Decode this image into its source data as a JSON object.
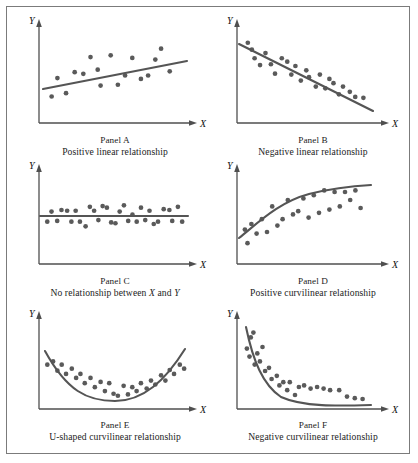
{
  "figure": {
    "border_color": "#7b7b7b",
    "background": "#ffffff",
    "axis_color": "#4f4f4f",
    "point_color": "#5a5a5a",
    "curve_color": "#555555",
    "axis_label_x": "X",
    "axis_label_y": "Y"
  },
  "chart_data": [
    {
      "type": "scatter",
      "id": "panel-a",
      "title": "Panel A",
      "subtitle": "Positive linear relationship",
      "xlabel": "X",
      "ylabel": "Y",
      "xlim": [
        0,
        100
      ],
      "ylim": [
        0,
        100
      ],
      "grid": false,
      "legend": "none",
      "fit": {
        "kind": "line",
        "description": "positive linear trend",
        "y_at_xmin": 38,
        "y_at_xmax": 68
      },
      "points": [
        [
          6,
          22
        ],
        [
          10,
          44
        ],
        [
          16,
          26
        ],
        [
          22,
          51
        ],
        [
          28,
          49
        ],
        [
          33,
          69
        ],
        [
          38,
          54
        ],
        [
          40,
          35
        ],
        [
          47,
          71
        ],
        [
          52,
          36
        ],
        [
          57,
          47
        ],
        [
          62,
          68
        ],
        [
          68,
          43
        ],
        [
          73,
          47
        ],
        [
          78,
          66
        ],
        [
          82,
          79
        ],
        [
          88,
          52
        ]
      ]
    },
    {
      "type": "scatter",
      "id": "panel-b",
      "title": "Panel B",
      "subtitle": "Negative linear relationship",
      "xlabel": "X",
      "ylabel": "Y",
      "xlim": [
        0,
        100
      ],
      "ylim": [
        0,
        100
      ],
      "grid": false,
      "legend": "none",
      "fit": {
        "kind": "line",
        "description": "negative linear trend",
        "y_at_xmin": 80,
        "y_at_xmax": 14
      },
      "points": [
        [
          5,
          84
        ],
        [
          8,
          76
        ],
        [
          10,
          66
        ],
        [
          14,
          58
        ],
        [
          18,
          72
        ],
        [
          22,
          59
        ],
        [
          25,
          48
        ],
        [
          30,
          66
        ],
        [
          34,
          62
        ],
        [
          37,
          47
        ],
        [
          40,
          57
        ],
        [
          44,
          40
        ],
        [
          48,
          52
        ],
        [
          50,
          44
        ],
        [
          55,
          33
        ],
        [
          58,
          47
        ],
        [
          62,
          31
        ],
        [
          65,
          42
        ],
        [
          68,
          37
        ],
        [
          72,
          24
        ],
        [
          75,
          33
        ],
        [
          80,
          27
        ],
        [
          84,
          21
        ],
        [
          90,
          20
        ]
      ]
    },
    {
      "type": "scatter",
      "id": "panel-c",
      "title": "Panel C",
      "subtitle": "No relationship between X and Y",
      "subtitle_parts": [
        "No relationship between ",
        "X",
        " and ",
        "Y"
      ],
      "xlabel": "X",
      "ylabel": "Y",
      "xlim": [
        0,
        100
      ],
      "ylim": [
        0,
        100
      ],
      "grid": false,
      "legend": "none",
      "fit": {
        "kind": "line",
        "description": "flat horizontal trend",
        "y_at_xmin": 50,
        "y_at_xmax": 50
      },
      "points": [
        [
          3,
          44
        ],
        [
          6,
          57
        ],
        [
          10,
          45
        ],
        [
          13,
          59
        ],
        [
          17,
          58
        ],
        [
          20,
          44
        ],
        [
          23,
          58
        ],
        [
          26,
          44
        ],
        [
          30,
          38
        ],
        [
          33,
          63
        ],
        [
          36,
          58
        ],
        [
          39,
          46
        ],
        [
          42,
          64
        ],
        [
          45,
          62
        ],
        [
          48,
          43
        ],
        [
          51,
          42
        ],
        [
          54,
          57
        ],
        [
          57,
          65
        ],
        [
          60,
          45
        ],
        [
          63,
          53
        ],
        [
          66,
          44
        ],
        [
          69,
          62
        ],
        [
          72,
          46
        ],
        [
          75,
          58
        ],
        [
          78,
          41
        ],
        [
          81,
          44
        ],
        [
          85,
          60
        ],
        [
          89,
          59
        ],
        [
          91,
          45
        ],
        [
          95,
          63
        ],
        [
          98,
          44
        ]
      ]
    },
    {
      "type": "scatter",
      "id": "panel-d",
      "title": "Panel D",
      "subtitle": "Positive curvilinear relationship",
      "xlabel": "X",
      "ylabel": "Y",
      "xlim": [
        0,
        100
      ],
      "ylim": [
        0,
        100
      ],
      "grid": false,
      "legend": "none",
      "fit": {
        "kind": "log-curve",
        "description": "rising concave curve that flattens",
        "y_at_xmin": 22,
        "y_at_xmax": 74
      },
      "points": [
        [
          3,
          33
        ],
        [
          5,
          16
        ],
        [
          8,
          40
        ],
        [
          12,
          28
        ],
        [
          16,
          46
        ],
        [
          20,
          30
        ],
        [
          24,
          62
        ],
        [
          28,
          38
        ],
        [
          32,
          46
        ],
        [
          36,
          70
        ],
        [
          40,
          52
        ],
        [
          44,
          56
        ],
        [
          48,
          72
        ],
        [
          52,
          48
        ],
        [
          56,
          76
        ],
        [
          60,
          54
        ],
        [
          64,
          82
        ],
        [
          68,
          58
        ],
        [
          72,
          80
        ],
        [
          76,
          62
        ],
        [
          80,
          80
        ],
        [
          84,
          70
        ],
        [
          88,
          82
        ],
        [
          92,
          60
        ]
      ]
    },
    {
      "type": "scatter",
      "id": "panel-e",
      "title": "Panel E",
      "subtitle": "U-shaped curvilinear relationship",
      "xlabel": "X",
      "ylabel": "Y",
      "xlim": [
        0,
        100
      ],
      "ylim": [
        0,
        100
      ],
      "grid": false,
      "legend": "none",
      "fit": {
        "kind": "parabola",
        "description": "U-shaped curve with minimum near centre",
        "vertex_x": 52,
        "vertex_y": 12,
        "y_at_xmin": 62,
        "y_at_xmax": 62
      },
      "points": [
        [
          3,
          58
        ],
        [
          7,
          63
        ],
        [
          10,
          49
        ],
        [
          13,
          58
        ],
        [
          16,
          44
        ],
        [
          20,
          52
        ],
        [
          23,
          38
        ],
        [
          26,
          44
        ],
        [
          29,
          30
        ],
        [
          33,
          38
        ],
        [
          36,
          24
        ],
        [
          40,
          32
        ],
        [
          43,
          18
        ],
        [
          46,
          30
        ],
        [
          49,
          14
        ],
        [
          52,
          11
        ],
        [
          56,
          26
        ],
        [
          59,
          13
        ],
        [
          62,
          24
        ],
        [
          65,
          18
        ],
        [
          68,
          30
        ],
        [
          72,
          22
        ],
        [
          75,
          34
        ],
        [
          78,
          28
        ],
        [
          82,
          42
        ],
        [
          85,
          34
        ],
        [
          88,
          50
        ],
        [
          91,
          44
        ],
        [
          95,
          58
        ],
        [
          98,
          52
        ]
      ]
    },
    {
      "type": "scatter",
      "id": "panel-f",
      "title": "Panel F",
      "subtitle": "Negative curvilinear relationship",
      "xlabel": "X",
      "ylabel": "Y",
      "xlim": [
        0,
        100
      ],
      "ylim": [
        0,
        100
      ],
      "grid": false,
      "legend": "none",
      "fit": {
        "kind": "exponential-decay",
        "description": "steeply falling curve flattening toward zero",
        "y_at_xmin": 88,
        "y_at_xmax": 5
      },
      "points": [
        [
          3,
          68
        ],
        [
          5,
          58
        ],
        [
          6,
          82
        ],
        [
          8,
          88
        ],
        [
          9,
          48
        ],
        [
          11,
          62
        ],
        [
          13,
          52
        ],
        [
          15,
          70
        ],
        [
          17,
          40
        ],
        [
          20,
          44
        ],
        [
          22,
          30
        ],
        [
          26,
          34
        ],
        [
          28,
          22
        ],
        [
          31,
          26
        ],
        [
          34,
          16
        ],
        [
          36,
          26
        ],
        [
          40,
          10
        ],
        [
          43,
          20
        ],
        [
          47,
          22
        ],
        [
          52,
          18
        ],
        [
          57,
          20
        ],
        [
          62,
          18
        ],
        [
          67,
          16
        ],
        [
          74,
          16
        ],
        [
          80,
          8
        ],
        [
          86,
          6
        ],
        [
          92,
          5
        ]
      ]
    }
  ]
}
